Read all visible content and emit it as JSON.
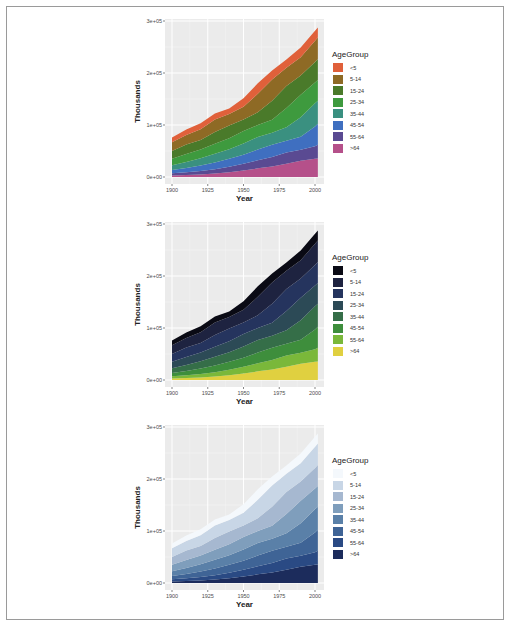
{
  "chart_data": [
    {
      "type": "area",
      "stacked": true,
      "title": "",
      "xlabel": "Year",
      "ylabel": "Thousands",
      "xlim": [
        1900,
        2002
      ],
      "ylim": [
        0,
        300000
      ],
      "x_ticks": [
        "1900",
        "1925",
        "1950",
        "1975",
        "2000"
      ],
      "y_ticks": [
        "0e+00",
        "1e+05",
        "2e+05",
        "3e+05"
      ],
      "grid": true,
      "legend_position": "right",
      "legend_title": "AgeGroup",
      "palette": "hue",
      "x": [
        1900,
        1910,
        1920,
        1930,
        1940,
        1950,
        1960,
        1970,
        1980,
        1990,
        2000,
        2002
      ],
      "series": [
        {
          "name": "<5",
          "color": "#e0603a",
          "values": [
            9200,
            10600,
            11600,
            11400,
            10600,
            16400,
            20300,
            17200,
            16300,
            18800,
            19200,
            19400
          ]
        },
        {
          "name": "5-14",
          "color": "#8e6a25",
          "values": [
            16900,
            18300,
            20800,
            24200,
            22400,
            24300,
            35500,
            40700,
            34900,
            35000,
            41100,
            41100
          ]
        },
        {
          "name": "15-24",
          "color": "#4a7a2a",
          "values": [
            14900,
            18100,
            18000,
            22500,
            24100,
            22100,
            24600,
            36500,
            42400,
            37000,
            39200,
            40500
          ]
        },
        {
          "name": "25-34",
          "color": "#3e9a3e",
          "values": [
            12200,
            15400,
            17100,
            18900,
            21300,
            24000,
            22900,
            25300,
            37100,
            43200,
            39900,
            39900
          ]
        },
        {
          "name": "35-44",
          "color": "#3a9080",
          "values": [
            9200,
            11500,
            14100,
            16900,
            18300,
            21500,
            24200,
            23100,
            25600,
            37400,
            45100,
            44300
          ]
        },
        {
          "name": "45-54",
          "color": "#3f6fc0",
          "values": [
            6400,
            8400,
            10500,
            13000,
            15500,
            17400,
            20600,
            23200,
            22700,
            25200,
            37600,
            40100
          ]
        },
        {
          "name": "55-64",
          "color": "#5a4a92",
          "values": [
            4000,
            5100,
            6500,
            8400,
            10600,
            13300,
            15600,
            18600,
            21700,
            21100,
            24300,
            26600
          ]
        },
        {
          "name": ">64",
          "color": "#b5508a",
          "values": [
            3100,
            4000,
            4900,
            6600,
            9000,
            12300,
            16600,
            20100,
            25500,
            31200,
            35000,
            35600
          ]
        }
      ]
    },
    {
      "type": "area",
      "stacked": true,
      "title": "",
      "xlabel": "Year",
      "ylabel": "Thousands",
      "xlim": [
        1900,
        2002
      ],
      "ylim": [
        0,
        300000
      ],
      "x_ticks": [
        "1900",
        "1925",
        "1950",
        "1975",
        "2000"
      ],
      "y_ticks": [
        "0e+00",
        "1e+05",
        "2e+05",
        "3e+05"
      ],
      "grid": true,
      "legend_position": "right",
      "legend_title": "AgeGroup",
      "palette": "viridis-like",
      "same_data_as": 0,
      "series_colors": {
        "<5": "#0a0a14",
        "5-14": "#1e2340",
        "15-24": "#25345e",
        "25-34": "#2c4a56",
        "35-44": "#356e48",
        "45-54": "#3e8e3c",
        "55-64": "#7ab83a",
        ">64": "#e0d040"
      }
    },
    {
      "type": "area",
      "stacked": true,
      "title": "",
      "xlabel": "Year",
      "ylabel": "Thousands",
      "xlim": [
        1900,
        2002
      ],
      "ylim": [
        0,
        300000
      ],
      "x_ticks": [
        "1900",
        "1925",
        "1950",
        "1975",
        "2000"
      ],
      "y_ticks": [
        "0e+00",
        "1e+05",
        "2e+05",
        "3e+05"
      ],
      "grid": true,
      "legend_position": "right",
      "legend_title": "AgeGroup",
      "palette": "blues",
      "same_data_as": 0,
      "series_colors": {
        "<5": "#f4f8fc",
        "5-14": "#c8d6e6",
        "15-24": "#a6b8d0",
        "25-34": "#7f9ebc",
        "35-44": "#5a80a8",
        "45-54": "#3f6496",
        "55-64": "#2a4a84",
        ">64": "#1c2c5c"
      }
    }
  ],
  "charts": [
    {
      "xlabel": "Year",
      "ylabel": "Thousands",
      "legend_title": "AgeGroup",
      "y_ticks": [
        "0e+00",
        "1e+05",
        "2e+05",
        "3e+05"
      ],
      "x_ticks": [
        "1900",
        "1925",
        "1950",
        "1975",
        "2000"
      ],
      "legend": [
        {
          "label": "<5",
          "color": "#e0603a"
        },
        {
          "label": "5-14",
          "color": "#8e6a25"
        },
        {
          "label": "15-24",
          "color": "#4a7a2a"
        },
        {
          "label": "25-34",
          "color": "#3e9a3e"
        },
        {
          "label": "35-44",
          "color": "#3a9080"
        },
        {
          "label": "45-54",
          "color": "#3f6fc0"
        },
        {
          "label": "55-64",
          "color": "#5a4a92"
        },
        {
          "label": ">64",
          "color": "#b5508a"
        }
      ]
    },
    {
      "xlabel": "Year",
      "ylabel": "Thousands",
      "legend_title": "AgeGroup",
      "y_ticks": [
        "0e+00",
        "1e+05",
        "2e+05",
        "3e+05"
      ],
      "x_ticks": [
        "1900",
        "1925",
        "1950",
        "1975",
        "2000"
      ],
      "legend": [
        {
          "label": "<5",
          "color": "#0a0a14"
        },
        {
          "label": "5-14",
          "color": "#1e2340"
        },
        {
          "label": "15-24",
          "color": "#25345e"
        },
        {
          "label": "25-34",
          "color": "#2c4a56"
        },
        {
          "label": "35-44",
          "color": "#356e48"
        },
        {
          "label": "45-54",
          "color": "#3e8e3c"
        },
        {
          "label": "55-64",
          "color": "#7ab83a"
        },
        {
          "label": ">64",
          "color": "#e0d040"
        }
      ]
    },
    {
      "xlabel": "Year",
      "ylabel": "Thousands",
      "legend_title": "AgeGroup",
      "y_ticks": [
        "0e+00",
        "1e+05",
        "2e+05",
        "3e+05"
      ],
      "x_ticks": [
        "1900",
        "1925",
        "1950",
        "1975",
        "2000"
      ],
      "legend": [
        {
          "label": "<5",
          "color": "#f4f8fc"
        },
        {
          "label": "5-14",
          "color": "#c8d6e6"
        },
        {
          "label": "15-24",
          "color": "#a6b8d0"
        },
        {
          "label": "25-34",
          "color": "#7f9ebc"
        },
        {
          "label": "35-44",
          "color": "#5a80a8"
        },
        {
          "label": "45-54",
          "color": "#3f6496"
        },
        {
          "label": "55-64",
          "color": "#2a4a84"
        },
        {
          "label": ">64",
          "color": "#1c2c5c"
        }
      ]
    }
  ],
  "theme": {
    "panel_bg": "#ebebeb",
    "grid_major": "#ffffff",
    "grid_minor": "#f5f5f5",
    "frame_border": "#9a9a9a"
  }
}
